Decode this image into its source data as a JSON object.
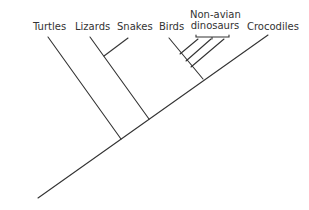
{
  "diagram": {
    "type": "cladogram",
    "taxa": [
      {
        "id": "turtles",
        "label": "Turtles"
      },
      {
        "id": "lizards",
        "label": "Lizards"
      },
      {
        "id": "snakes",
        "label": "Snakes"
      },
      {
        "id": "birds",
        "label": "Birds"
      },
      {
        "id": "non_avian_dinosaurs",
        "label_line1": "Non-avian",
        "label_line2": "dinosaurs"
      },
      {
        "id": "crocodiles",
        "label": "Crocodiles"
      }
    ],
    "line_color": "#333333"
  }
}
